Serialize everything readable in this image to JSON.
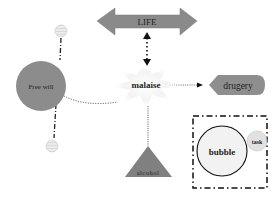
{
  "diagram": {
    "nodes": {
      "life": {
        "label": "LIFE",
        "shape": "double-arrow",
        "color": "#8a8a8a"
      },
      "free_will": {
        "label": "Free will",
        "shape": "circle",
        "color": "#8c8c8c"
      },
      "malaise": {
        "label": "malaise",
        "shape": "starburst",
        "color": "#f2f2f2"
      },
      "drugery": {
        "label": "drugery",
        "shape": "display-hexagon",
        "color": "#8e8e8e"
      },
      "alcohol": {
        "label": "alcohol",
        "shape": "triangle",
        "color": "#808080"
      },
      "bubble": {
        "label": "bubble",
        "shape": "circle",
        "color": "#f2f2f2"
      },
      "task": {
        "label": "task",
        "shape": "circle",
        "color": "#dcdcdc"
      }
    },
    "connectors": [
      {
        "from": "life",
        "to": "malaise",
        "style": "dotted",
        "arrows": "both"
      },
      {
        "from": "malaise",
        "to": "drugery",
        "style": "dotted",
        "arrows": "end"
      },
      {
        "from": "malaise",
        "to": "alcohol",
        "style": "dotted",
        "arrows": "none"
      },
      {
        "from": "free_will",
        "to": "malaise",
        "style": "dotted",
        "arrows": "none"
      },
      {
        "from": "free_will",
        "to": "small-circle-top",
        "style": "dash-dot",
        "arrows": "none"
      },
      {
        "from": "free_will",
        "to": "small-circle-bottom",
        "style": "dash-dot",
        "arrows": "none"
      }
    ],
    "group_box": {
      "style": "dash-dot",
      "contains": [
        "bubble",
        "task"
      ]
    }
  }
}
